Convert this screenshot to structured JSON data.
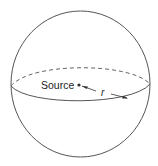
{
  "diagram": {
    "labels": {
      "source": "Source",
      "radius": "r"
    },
    "colors": {
      "stroke": "#555555",
      "text": "#222222",
      "background": "#ffffff"
    }
  }
}
